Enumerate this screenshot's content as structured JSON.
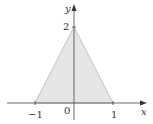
{
  "figure": {
    "type": "shaded-region-plot",
    "axes": {
      "x_label": "x",
      "y_label": "y",
      "origin_label": "0",
      "x_ticks": [
        "−1",
        "1"
      ],
      "y_ticks": [
        "2"
      ]
    },
    "region": {
      "vertices": [
        [
          -1,
          0
        ],
        [
          0,
          2
        ],
        [
          1,
          0
        ]
      ],
      "fill_color": "#e6e6e6",
      "edge_color": "#b0b0b0"
    },
    "axis_color": "#444444"
  }
}
